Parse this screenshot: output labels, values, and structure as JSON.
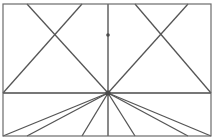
{
  "figure": {
    "type": "line-diagram",
    "canvas": {
      "width": 218,
      "height": 139,
      "background_color": "#ffffff"
    },
    "style": {
      "border_color": "#6b6b6b",
      "border_width": 1.2,
      "line_color": "#4a4a4a",
      "line_width": 1.3,
      "diagonal_color": "#555555",
      "diagonal_width": 1.3
    },
    "geometry": {
      "rect_left": 3,
      "rect_right": 211,
      "rect_top": 4,
      "rect_bottom": 136,
      "midline_y": 93,
      "center_x": 108,
      "center_y": 93,
      "top_node_y": 4,
      "bottom_node_y": 136,
      "node_x_positions": [
        27,
        82,
        135,
        188
      ],
      "upper_cross_y": 35,
      "left_cross_x": 55,
      "right_cross_x": 161
    },
    "border": {
      "label": "outer-rectangle",
      "x": 3,
      "y": 4,
      "width": 208,
      "height": 132
    },
    "lines": [
      {
        "name": "horizontal-midline",
        "x1": 3,
        "y1": 93,
        "x2": 211,
        "y2": 93,
        "kind": "axis"
      },
      {
        "name": "vertical-centerline",
        "x1": 108,
        "y1": 4,
        "x2": 108,
        "y2": 136,
        "kind": "axis"
      },
      {
        "name": "upper-diagonal-left-outer",
        "x1": 27,
        "y1": 4,
        "x2": 108,
        "y2": 93,
        "kind": "diagonal"
      },
      {
        "name": "upper-diagonal-left-inner",
        "x1": 82,
        "y1": 4,
        "x2": 3,
        "y2": 93,
        "kind": "diagonal"
      },
      {
        "name": "upper-diagonal-right-inner",
        "x1": 135,
        "y1": 4,
        "x2": 211,
        "y2": 93,
        "kind": "diagonal"
      },
      {
        "name": "upper-diagonal-right-outer",
        "x1": 188,
        "y1": 4,
        "x2": 108,
        "y2": 93,
        "kind": "diagonal"
      },
      {
        "name": "lower-diagonal-left-outer",
        "x1": 27,
        "y1": 136,
        "x2": 108,
        "y2": 93,
        "kind": "diagonal"
      },
      {
        "name": "lower-diagonal-left-corner",
        "x1": 3,
        "y1": 136,
        "x2": 108,
        "y2": 93,
        "kind": "diagonal"
      },
      {
        "name": "lower-diagonal-left-inner",
        "x1": 82,
        "y1": 136,
        "x2": 108,
        "y2": 93,
        "kind": "diagonal"
      },
      {
        "name": "lower-diagonal-right-inner",
        "x1": 135,
        "y1": 136,
        "x2": 108,
        "y2": 93,
        "kind": "diagonal"
      },
      {
        "name": "lower-diagonal-right-outer",
        "x1": 188,
        "y1": 136,
        "x2": 108,
        "y2": 93,
        "kind": "diagonal"
      },
      {
        "name": "lower-diagonal-right-corner",
        "x1": 211,
        "y1": 136,
        "x2": 108,
        "y2": 93,
        "kind": "diagonal"
      }
    ],
    "center_node": {
      "name": "center-star-node",
      "x": 108,
      "y": 93,
      "radius": 2.6,
      "ray_count": 8
    },
    "upper_node": {
      "name": "upper-crossing-node",
      "x": 108,
      "y": 35,
      "radius": 1.8
    }
  }
}
